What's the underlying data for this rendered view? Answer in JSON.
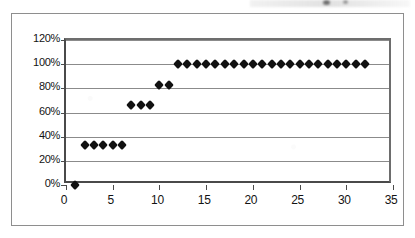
{
  "chart_data": {
    "type": "scatter",
    "title": "",
    "subtitle": "",
    "xlabel": "",
    "ylabel": "",
    "xlim": [
      0,
      35
    ],
    "ylim": [
      0,
      1.2
    ],
    "ytick_labels": [
      "0%",
      "20%",
      "40%",
      "60%",
      "80%",
      "100%",
      "120%"
    ],
    "ytick_values": [
      0,
      0.2,
      0.4,
      0.6,
      0.8,
      1.0,
      1.2
    ],
    "xtick_labels": [
      "0",
      "5",
      "10",
      "15",
      "20",
      "25",
      "30",
      "35"
    ],
    "xtick_values": [
      0,
      5,
      10,
      15,
      20,
      25,
      30,
      35
    ],
    "grid": "horizontal",
    "legend": "none",
    "series": [
      {
        "name": "cumulative-percentage",
        "marker": "diamond",
        "color": "#111111",
        "x": [
          1,
          2,
          3,
          4,
          5,
          6,
          7,
          8,
          9,
          10,
          11,
          12,
          13,
          14,
          15,
          16,
          17,
          18,
          19,
          20,
          21,
          22,
          23,
          24,
          25,
          26,
          27,
          28,
          29,
          30,
          31,
          32
        ],
        "y": [
          0.0,
          0.33,
          0.33,
          0.33,
          0.33,
          0.33,
          0.66,
          0.66,
          0.66,
          0.83,
          0.83,
          1.0,
          1.0,
          1.0,
          1.0,
          1.0,
          1.0,
          1.0,
          1.0,
          1.0,
          1.0,
          1.0,
          1.0,
          1.0,
          1.0,
          1.0,
          1.0,
          1.0,
          1.0,
          1.0,
          1.0,
          1.0
        ],
        "y_labels": [
          "0%",
          "33%",
          "33%",
          "33%",
          "33%",
          "33%",
          "66%",
          "66%",
          "66%",
          "83%",
          "83%",
          "100%",
          "100%",
          "100%",
          "100%",
          "100%",
          "100%",
          "100%",
          "100%",
          "100%",
          "100%",
          "100%",
          "100%",
          "100%",
          "100%",
          "100%",
          "100%",
          "100%",
          "100%",
          "100%",
          "100%",
          "100%"
        ]
      }
    ],
    "annotations": []
  },
  "colors": {
    "marker": "#111111",
    "gridline": "#8b8b8b",
    "axis": "#4a4a4a",
    "frame": "#8e8e8e",
    "background": "#ffffff",
    "text": "#131313"
  }
}
